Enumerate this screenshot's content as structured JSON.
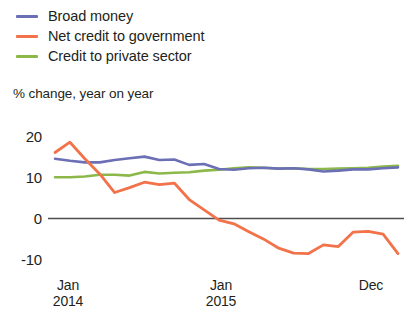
{
  "legend": {
    "position": "top-left",
    "items": [
      {
        "label": "Broad money",
        "color": "#6b6fb5",
        "icon": "line-swatch-icon"
      },
      {
        "label": "Net credit to government",
        "color": "#f2724a",
        "icon": "line-swatch-icon"
      },
      {
        "label": "Credit to private sector",
        "color": "#8cb84a",
        "icon": "line-swatch-icon"
      }
    ]
  },
  "axis_caption": "% change, year on year",
  "y_axis": {
    "ticks": [
      "20",
      "10",
      "0",
      "-10"
    ],
    "values": [
      20,
      10,
      0,
      -10
    ],
    "min": -13,
    "max": 22
  },
  "x_axis": {
    "ticks": [
      {
        "month": "Jan",
        "year": "2014"
      },
      {
        "month": "Jan",
        "year": "2015"
      },
      {
        "month": "Dec",
        "year": ""
      }
    ]
  },
  "zero_line_color": "#4d4d4d",
  "chart_data": {
    "type": "line",
    "title": "",
    "subtitle": "",
    "xlabel": "",
    "ylabel": "% change, year on year",
    "ylim": [
      -13,
      22
    ],
    "grid": false,
    "legend_position": "top-left",
    "x": [
      "Jan 2014",
      "Feb 2014",
      "Mar 2014",
      "Apr 2014",
      "May 2014",
      "Jun 2014",
      "Jul 2014",
      "Aug 2014",
      "Sep 2014",
      "Oct 2014",
      "Nov 2014",
      "Dec 2014",
      "Jan 2015",
      "Feb 2015",
      "Mar 2015",
      "Apr 2015",
      "May 2015",
      "Jun 2015",
      "Jul 2015",
      "Aug 2015",
      "Sep 2015",
      "Oct 2015",
      "Nov 2015",
      "Dec 2015"
    ],
    "series": [
      {
        "name": "Broad money",
        "color": "#6b6fb5",
        "values": [
          14.5,
          14.0,
          13.6,
          13.6,
          14.2,
          14.6,
          15.0,
          14.2,
          14.3,
          13.0,
          13.2,
          12.0,
          11.8,
          12.2,
          12.3,
          12.1,
          12.2,
          11.9,
          11.4,
          11.6,
          11.9,
          11.9,
          12.2,
          12.4
        ]
      },
      {
        "name": "Net credit to government",
        "color": "#f2724a",
        "values": [
          16.0,
          18.5,
          14.5,
          10.8,
          6.3,
          7.5,
          8.8,
          8.2,
          8.6,
          4.6,
          2.1,
          -0.4,
          -1.3,
          -3.2,
          -5.0,
          -7.2,
          -8.4,
          -8.5,
          -6.4,
          -6.8,
          -3.3,
          -3.1,
          -3.8,
          -8.5
        ]
      },
      {
        "name": "Credit to private sector",
        "color": "#8cb84a",
        "values": [
          10.0,
          10.0,
          10.2,
          10.6,
          10.6,
          10.4,
          11.3,
          10.9,
          11.1,
          11.2,
          11.6,
          11.8,
          12.2,
          12.4,
          12.3,
          12.1,
          12.2,
          12.0,
          12.0,
          12.1,
          12.2,
          12.3,
          12.6,
          12.8
        ]
      }
    ]
  }
}
